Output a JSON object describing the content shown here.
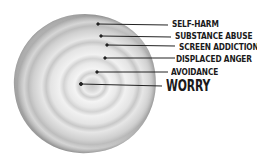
{
  "diagram": {
    "layers": [
      {
        "label": "SELF-HARM",
        "level": "outermost"
      },
      {
        "label": "SUBSTANCE ABUSE"
      },
      {
        "label": "SCREEN ADDICTION"
      },
      {
        "label": "DISPLACED ANGER"
      },
      {
        "label": "AVOIDANCE"
      },
      {
        "label": "WORRY",
        "level": "core",
        "emphasized": true
      }
    ]
  }
}
